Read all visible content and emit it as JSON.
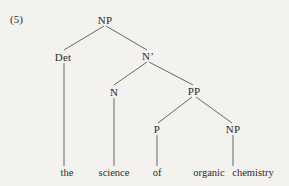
{
  "figure": {
    "example_number": "(5)",
    "background_color": "#f3f2ef",
    "text_color": "#2b2b2b",
    "line_color": "#585858",
    "width": 289,
    "height": 186
  },
  "tree": {
    "nodes": [
      {
        "id": "np-root",
        "label": "NP",
        "x": 105,
        "y": 20
      },
      {
        "id": "det",
        "label": "Det",
        "x": 63,
        "y": 57
      },
      {
        "id": "nbar",
        "label": "N’",
        "x": 148,
        "y": 56
      },
      {
        "id": "n",
        "label": "N",
        "x": 114,
        "y": 92
      },
      {
        "id": "pp",
        "label": "PP",
        "x": 194,
        "y": 91
      },
      {
        "id": "p",
        "label": "P",
        "x": 157,
        "y": 129
      },
      {
        "id": "np-obj",
        "label": "NP",
        "x": 233,
        "y": 129
      }
    ],
    "terminals": [
      {
        "id": "term-the",
        "label": "the",
        "x": 67,
        "y": 172
      },
      {
        "id": "term-science",
        "label": "science",
        "x": 114,
        "y": 172
      },
      {
        "id": "term-of",
        "label": "of",
        "x": 157,
        "y": 172
      },
      {
        "id": "term-organic",
        "label": "organic",
        "x": 209,
        "y": 172
      },
      {
        "id": "term-chemistry",
        "label": "chemistry",
        "x": 253,
        "y": 172
      }
    ],
    "edges": [
      {
        "id": "edge-np-det",
        "from": "np-root",
        "to": "det",
        "x1": 104,
        "y1": 26,
        "x2": 64,
        "y2": 50
      },
      {
        "id": "edge-np-nbar",
        "from": "np-root",
        "to": "nbar",
        "x1": 106,
        "y1": 26,
        "x2": 147,
        "y2": 50
      },
      {
        "id": "edge-nbar-n",
        "from": "nbar",
        "to": "n",
        "x1": 147,
        "y1": 62,
        "x2": 114,
        "y2": 85
      },
      {
        "id": "edge-nbar-pp",
        "from": "nbar",
        "to": "pp",
        "x1": 149,
        "y1": 62,
        "x2": 193,
        "y2": 85
      },
      {
        "id": "edge-pp-p",
        "from": "pp",
        "to": "p",
        "x1": 192,
        "y1": 97,
        "x2": 158,
        "y2": 123
      },
      {
        "id": "edge-pp-np",
        "from": "pp",
        "to": "np-obj",
        "x1": 196,
        "y1": 97,
        "x2": 232,
        "y2": 123
      },
      {
        "id": "edge-det-the",
        "from": "det",
        "to": "term-the",
        "x1": 64,
        "y1": 63,
        "x2": 64,
        "y2": 166
      },
      {
        "id": "edge-n-science",
        "from": "n",
        "to": "term-science",
        "x1": 114,
        "y1": 98,
        "x2": 114,
        "y2": 166
      },
      {
        "id": "edge-p-of",
        "from": "p",
        "to": "term-of",
        "x1": 157,
        "y1": 135,
        "x2": 157,
        "y2": 166
      },
      {
        "id": "edge-np-organic",
        "from": "np-obj",
        "to": "term-chemistry",
        "x1": 233,
        "y1": 135,
        "x2": 233,
        "y2": 166
      }
    ],
    "phrase": "the science of organic chemistry"
  }
}
